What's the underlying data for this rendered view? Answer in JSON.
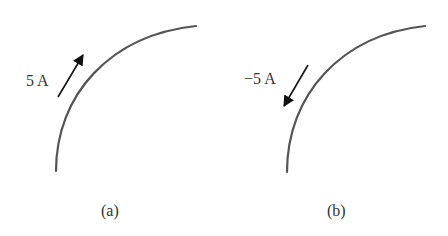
{
  "figure": {
    "panels": [
      {
        "id": "a",
        "caption": "(a)",
        "current_label": "5 A",
        "arrow_direction": "up-right (along wire)"
      },
      {
        "id": "b",
        "caption": "(b)",
        "current_label": "−5 A",
        "arrow_direction": "down-left (against wire)"
      }
    ],
    "colors": {
      "wire": "#555555",
      "arrow": "#111111",
      "text": "#333333",
      "background": "#ffffff"
    }
  }
}
